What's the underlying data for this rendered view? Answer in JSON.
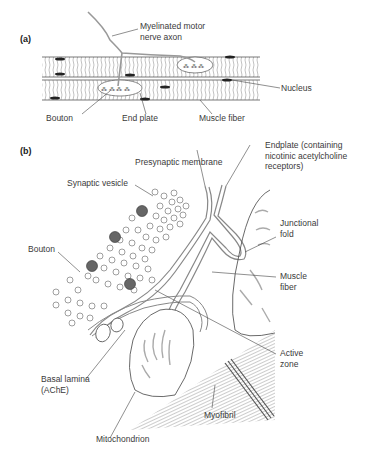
{
  "figure": {
    "panel_a": {
      "tag": "(a)",
      "labels": {
        "axon_line1": "Myelinated motor",
        "axon_line2": "nerve axon",
        "nucleus": "Nucleus",
        "bouton": "Bouton",
        "end_plate": "End plate",
        "muscle_fiber": "Muscle fiber"
      }
    },
    "panel_b": {
      "tag": "(b)",
      "labels": {
        "presynaptic_membrane": "Presynaptic membrane",
        "endplate_line1": "Endplate (containing",
        "endplate_line2": "nicotinic acetylcholine",
        "endplate_line3": "receptors)",
        "synaptic_vesicle": "Synaptic vesicle",
        "junctional_line1": "Junctional",
        "junctional_line2": "fold",
        "bouton": "Bouton",
        "muscle_line1": "Muscle",
        "muscle_line2": "fiber",
        "basal_line1": "Basal lamina",
        "basal_line2": "(AChE)",
        "active_line1": "Active",
        "active_line2": "zone",
        "myofibril": "Myofibril",
        "mitochondrion": "Mitochondrion"
      }
    },
    "colors": {
      "line": "#444444",
      "membrane": "#8a8a8a",
      "vesicle_dense": "#555555"
    }
  }
}
